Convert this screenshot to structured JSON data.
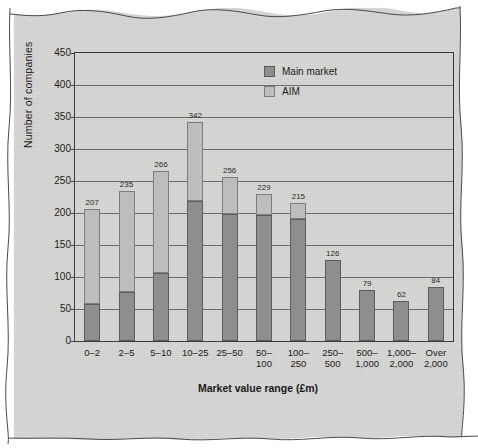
{
  "chart_data": {
    "type": "bar",
    "stacked": true,
    "title": "",
    "xlabel": "Market value range (£m)",
    "ylabel": "Number of companies",
    "ylim": [
      0,
      450
    ],
    "ytick_step": 50,
    "yticks": [
      "0",
      "50",
      "100",
      "150",
      "200",
      "250",
      "300",
      "350",
      "400",
      "450"
    ],
    "grid": "horizontal",
    "legend_position": "top-right",
    "categories": [
      "0–2",
      "2–5",
      "5–10",
      "10–25",
      "25–50",
      "50–100",
      "100–250",
      "250–500",
      "500–1,000",
      "1,000–2,000",
      "Over 2,000"
    ],
    "category_lines": [
      [
        "0–2",
        ""
      ],
      [
        "2–5",
        ""
      ],
      [
        "5–10",
        ""
      ],
      [
        "10–25",
        ""
      ],
      [
        "25–50",
        ""
      ],
      [
        "50–",
        "100"
      ],
      [
        "100–",
        "250"
      ],
      [
        "250–",
        "500"
      ],
      [
        "500–",
        "1,000"
      ],
      [
        "1,000–",
        "2,000"
      ],
      [
        "Over",
        "2,000"
      ]
    ],
    "series": [
      {
        "name": "Main market",
        "color": "#8e8e8e",
        "values": [
          58,
          76,
          107,
          219,
          199,
          197,
          191,
          126,
          79,
          62,
          84
        ]
      },
      {
        "name": "AIM",
        "color": "#bdbdbd",
        "values": [
          149,
          159,
          159,
          123,
          57,
          32,
          24,
          0,
          0,
          0,
          0
        ]
      }
    ],
    "totals": [
      207,
      235,
      266,
      342,
      256,
      229,
      215,
      126,
      79,
      62,
      84
    ],
    "total_labels": [
      "207",
      "235",
      "266",
      "342",
      "256",
      "229",
      "215",
      "126",
      "79",
      "62",
      "84"
    ]
  },
  "legend": {
    "items": [
      {
        "label": "Main market",
        "color": "#8e8e8e"
      },
      {
        "label": "AIM",
        "color": "#bdbdbd"
      }
    ]
  }
}
